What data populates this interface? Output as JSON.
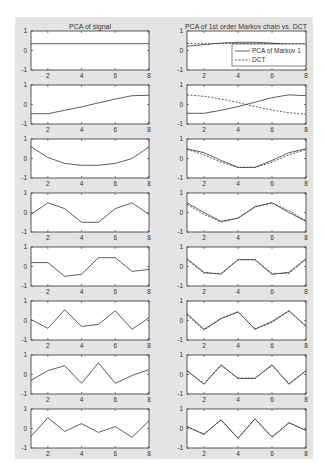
{
  "figure": {
    "background": "#e4e4e4",
    "axes_background": "#ffffff",
    "line_color": "#333333"
  },
  "columns": [
    {
      "title": "PCA of signal"
    },
    {
      "title": "PCA of 1st order Markov chain vs. DCT"
    }
  ],
  "legend": {
    "items": [
      {
        "label": "PCA of Markov 1",
        "style": "solid"
      },
      {
        "label": "DCT",
        "style": "dashed"
      }
    ]
  },
  "chart_data": [
    {
      "type": "line",
      "title": "PCA of signal",
      "layout": "8 stacked subplots",
      "x": [
        1,
        2,
        3,
        4,
        5,
        6,
        7,
        8
      ],
      "xticks": [
        2,
        4,
        6,
        8
      ],
      "yticks": [
        -1,
        0,
        1
      ],
      "xlim": [
        1,
        8
      ],
      "ylim": [
        -1,
        1
      ],
      "grid": false,
      "series": [
        {
          "name": "component 1",
          "values": [
            0.35,
            0.35,
            0.35,
            0.35,
            0.35,
            0.35,
            0.35,
            0.35
          ]
        },
        {
          "name": "component 2",
          "values": [
            -0.47,
            -0.47,
            -0.3,
            -0.12,
            0.08,
            0.28,
            0.45,
            0.47
          ]
        },
        {
          "name": "component 3",
          "values": [
            0.6,
            0.05,
            -0.25,
            -0.35,
            -0.35,
            -0.25,
            0.0,
            0.6
          ]
        },
        {
          "name": "component 4",
          "values": [
            -0.1,
            0.5,
            0.2,
            -0.5,
            -0.5,
            0.2,
            0.5,
            -0.1
          ]
        },
        {
          "name": "component 5",
          "values": [
            0.2,
            0.2,
            -0.5,
            -0.4,
            0.45,
            0.45,
            -0.25,
            -0.15
          ]
        },
        {
          "name": "component 6",
          "values": [
            0.05,
            -0.4,
            0.55,
            -0.3,
            -0.2,
            0.5,
            -0.45,
            0.15
          ]
        },
        {
          "name": "component 7",
          "values": [
            -0.3,
            0.2,
            0.45,
            -0.45,
            0.6,
            -0.45,
            -0.05,
            0.25
          ]
        },
        {
          "name": "component 8",
          "values": [
            -0.4,
            0.55,
            -0.15,
            0.25,
            -0.2,
            0.1,
            -0.45,
            0.4
          ]
        }
      ]
    },
    {
      "type": "line",
      "title": "PCA of 1st order Markov chain vs. DCT",
      "layout": "8 stacked subplots",
      "x": [
        1,
        2,
        3,
        4,
        5,
        6,
        7,
        8
      ],
      "xticks": [
        2,
        4,
        6,
        8
      ],
      "yticks": [
        -1,
        0,
        1
      ],
      "xlim": [
        1,
        8
      ],
      "ylim": [
        -1,
        1
      ],
      "grid": false,
      "legend": [
        "PCA of Markov 1",
        "DCT"
      ],
      "legend_position": "lower right of first subplot",
      "subplots": [
        {
          "pca": [
            0.22,
            0.3,
            0.38,
            0.42,
            0.42,
            0.38,
            0.3,
            0.22
          ],
          "dct": [
            0.354,
            0.354,
            0.354,
            0.354,
            0.354,
            0.354,
            0.354,
            0.354
          ]
        },
        {
          "pca": [
            -0.45,
            -0.45,
            -0.3,
            -0.1,
            0.12,
            0.35,
            0.5,
            0.45
          ],
          "dct": [
            0.49,
            0.42,
            0.28,
            0.1,
            -0.1,
            -0.28,
            -0.42,
            -0.49
          ]
        },
        {
          "pca": [
            0.5,
            0.3,
            -0.1,
            -0.45,
            -0.45,
            -0.1,
            0.3,
            0.5
          ],
          "dct": [
            0.46,
            0.19,
            -0.19,
            -0.46,
            -0.46,
            -0.19,
            0.19,
            0.46
          ]
        },
        {
          "pca": [
            0.5,
            0.0,
            -0.45,
            -0.3,
            0.3,
            0.5,
            0.0,
            -0.45
          ],
          "dct": [
            0.42,
            -0.1,
            -0.49,
            -0.28,
            0.28,
            0.49,
            0.1,
            -0.42
          ]
        },
        {
          "pca": [
            0.4,
            -0.3,
            -0.4,
            0.35,
            0.35,
            -0.4,
            -0.3,
            0.4
          ],
          "dct": [
            0.354,
            -0.354,
            -0.354,
            0.354,
            0.354,
            -0.354,
            -0.354,
            0.354
          ]
        },
        {
          "pca": [
            0.35,
            -0.45,
            0.1,
            0.45,
            -0.45,
            -0.05,
            0.5,
            -0.3
          ],
          "dct": [
            0.28,
            -0.49,
            0.1,
            0.42,
            -0.42,
            -0.1,
            0.49,
            -0.28
          ]
        },
        {
          "pca": [
            0.2,
            -0.5,
            0.5,
            -0.2,
            -0.2,
            0.5,
            -0.5,
            0.2
          ],
          "dct": [
            0.19,
            -0.46,
            0.46,
            -0.19,
            -0.19,
            0.46,
            -0.46,
            0.19
          ]
        },
        {
          "pca": [
            0.1,
            -0.3,
            0.45,
            -0.5,
            0.5,
            -0.45,
            0.3,
            -0.1
          ],
          "dct": [
            0.1,
            -0.28,
            0.42,
            -0.49,
            0.49,
            -0.42,
            0.28,
            -0.1
          ]
        }
      ]
    }
  ]
}
